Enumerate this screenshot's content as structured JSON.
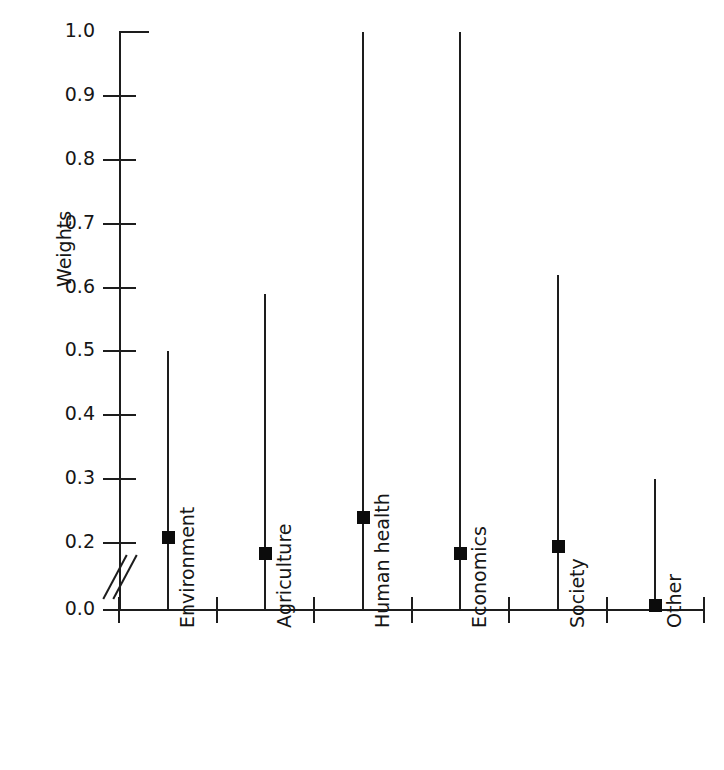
{
  "figure": {
    "top_crop_remnant": "··· ···· ··· ····· ···· ·· ······ ··· ····",
    "ink_color": "#1d1d1d",
    "background_color": "#ffffff",
    "marker_color": "#0c0c0c"
  },
  "chart_data": {
    "type": "scatter",
    "title": "",
    "subtitle": "",
    "xlabel": "",
    "ylabel": "Weights",
    "ylim": [
      0.0,
      1.0
    ],
    "grid": false,
    "legend": false,
    "legend_position": "none",
    "axis_break": {
      "present": true,
      "between": [
        0.0,
        0.2
      ],
      "symbol": "double-slash"
    },
    "ytick_labels": [
      "1.0",
      "0.9",
      "0.8",
      "0.7",
      "0.6",
      "0.5",
      "0.4",
      "0.3",
      "0.2",
      "0.0"
    ],
    "ytick_values": [
      1.0,
      0.9,
      0.8,
      0.7,
      0.6,
      0.5,
      0.4,
      0.3,
      0.2,
      0.0
    ],
    "categories": [
      "Environment",
      "Agriculture",
      "Human health",
      "Economics",
      "Society",
      "Other"
    ],
    "series": [
      {
        "name": "Median weight",
        "marker": "square",
        "values": [
          0.21,
          0.17,
          0.24,
          0.17,
          0.19,
          0.015
        ]
      },
      {
        "name": "Range maximum",
        "marker": "line",
        "values": [
          0.5,
          0.59,
          1.0,
          1.0,
          0.62,
          0.3
        ]
      },
      {
        "name": "Range minimum",
        "marker": "line",
        "values": [
          0.0,
          0.0,
          0.0,
          0.0,
          0.0,
          0.0
        ]
      }
    ],
    "annotations": []
  }
}
